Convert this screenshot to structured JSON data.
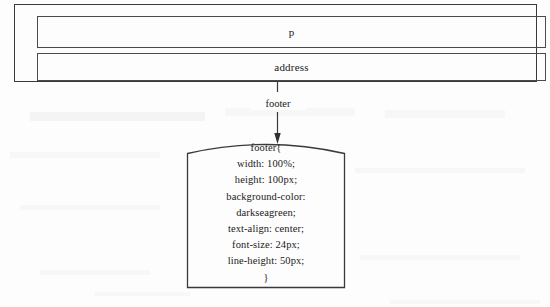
{
  "diagram": {
    "container": {
      "name": "element-container",
      "children": [
        {
          "label": "p"
        },
        {
          "label": "address"
        }
      ]
    },
    "connector": {
      "label": "footer",
      "direction": "down",
      "arrowhead": "filled-triangle"
    },
    "rule_box": {
      "shape": "arched-top-rectangle",
      "selector": "footer{",
      "closing": "}",
      "declarations": [
        "width: 100%;",
        "height: 100px;",
        "background-color:",
        "darkseagreen;",
        "text-align: center;",
        "font-size: 24px;",
        "line-height: 50px;"
      ],
      "lines": [
        "footer{",
        "width: 100%;",
        "height: 100px;",
        "background-color:",
        "darkseagreen;",
        "text-align: center;",
        "font-size: 24px;",
        "line-height: 50px;",
        "}"
      ]
    },
    "colors": {
      "background": "#fdfdfd",
      "stroke": "#3a3a3a",
      "inner_stroke": "#4a4a4a",
      "text": "#1a1a1a"
    }
  }
}
